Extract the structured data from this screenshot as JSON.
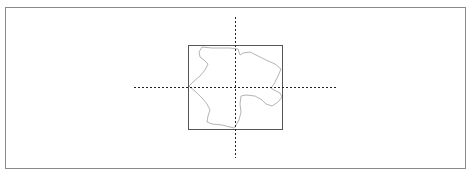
{
  "map": {
    "colors": {
      "frame": "#8a8a8a",
      "extent_box": "#555555",
      "crosshair": "#222222",
      "outline": "#b5b5b5",
      "background": "#ffffff"
    },
    "extent_box": {
      "x": 188,
      "y": 45,
      "width": 94,
      "height": 84
    },
    "crosshair": {
      "horizontal": {
        "x1": 134,
        "x2": 337,
        "y": 87
      },
      "vertical": {
        "x": 235,
        "y1": 17,
        "y2": 158
      }
    },
    "outline_path": "M202,47 L212,48 L220,48 L230,48 L238,49 L240,55 L243,53 L250,52 L258,56 L266,60 L275,64 L281,69 L278,76 L274,84 L271,88 L274,90 L280,93 L282,97 L278,102 L272,106 L266,104 L262,100 L255,96 L246,95 L241,96 L240,104 L241,112 L239,120 L236,125 L234,128 L230,127 L222,125 L212,124 L207,122 L208,116 L210,110 L207,104 L202,98 L196,92 L189,86 L193,82 L200,76 L205,70 L208,64 L204,60 L200,57 L199,52 Z"
  }
}
